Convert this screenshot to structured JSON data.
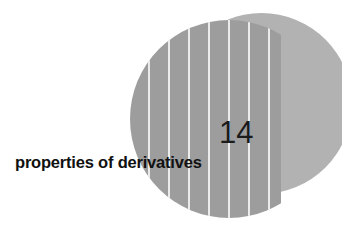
{
  "page": {
    "background_color": "#ffffff",
    "width": 352,
    "height": 237
  },
  "chapter": {
    "number": "14",
    "title": "properties of derivatives"
  },
  "graphic": {
    "disc": {
      "name": "striped-disc",
      "fill_color": "#9d9d9d",
      "stripe_color": "#ffffff",
      "stripe_count": 8
    },
    "crescent": {
      "name": "light-crescent",
      "fill_color": "#b2b2b2"
    }
  },
  "colors": {
    "disc_gray": "#9d9d9d",
    "crescent_gray": "#b2b2b2",
    "number_color": "#1b1b1b",
    "title_color": "#111111",
    "background": "#ffffff"
  }
}
